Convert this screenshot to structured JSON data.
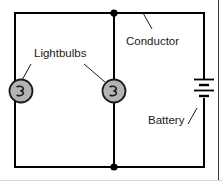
{
  "diagram": {
    "type": "electrical-circuit-schematic",
    "background_color": "#ffffff",
    "wire_color": "#000000",
    "component_fill": "#b3b3b3",
    "label_color": "#1a1a1a",
    "labels": {
      "lightbulbs": "Lightbulbs",
      "conductor": "Conductor",
      "battery": "Battery"
    },
    "components": {
      "lightbulb_left": {
        "name": "Lightbulb",
        "symbol": "lamp-circle-with-filament",
        "x": 21,
        "y": 91
      },
      "lightbulb_right": {
        "name": "Lightbulb",
        "symbol": "lamp-circle-with-filament",
        "x": 114,
        "y": 91
      },
      "battery_right": {
        "name": "Battery",
        "symbol": "battery-multi-cell-plates",
        "plate_count": 4,
        "x": 204,
        "y": 89
      }
    },
    "junctions": [
      {
        "name": "top-node",
        "x": 114,
        "y": 13
      },
      {
        "name": "bottom-node",
        "x": 114,
        "y": 167
      }
    ],
    "wires": {
      "left": 15,
      "right": 204,
      "top": 13,
      "bottom": 167,
      "middle_branch_x": 114
    }
  }
}
